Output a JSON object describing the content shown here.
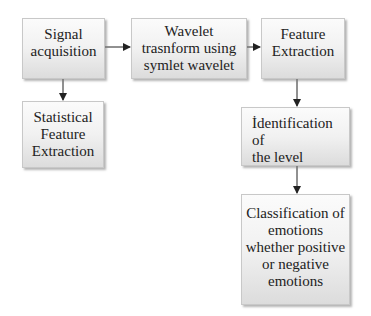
{
  "diagram": {
    "type": "flowchart",
    "nodes": [
      {
        "id": "signal",
        "label": "Signal\nacquisition"
      },
      {
        "id": "wavelet",
        "label": "Wavelet\ntrasnform using\nsymlet wavelet"
      },
      {
        "id": "feature",
        "label": "Feature\nExtraction"
      },
      {
        "id": "statistical",
        "label": "Statistical\nFeature\nExtraction"
      },
      {
        "id": "identification",
        "label": "İdentification  of\nthe level"
      },
      {
        "id": "classification",
        "label": "Classification of\nemotions\nwhether positive\nor negative\nemotions"
      }
    ],
    "edges": [
      {
        "from": "signal",
        "to": "wavelet"
      },
      {
        "from": "wavelet",
        "to": "feature"
      },
      {
        "from": "signal",
        "to": "statistical"
      },
      {
        "from": "feature",
        "to": "identification"
      },
      {
        "from": "identification",
        "to": "classification"
      }
    ],
    "colors": {
      "box_top": "#fbfbfb",
      "box_bottom": "#dcdcdc",
      "border": "#c8c8c8",
      "arrow": "#222222",
      "text": "#222222"
    }
  }
}
